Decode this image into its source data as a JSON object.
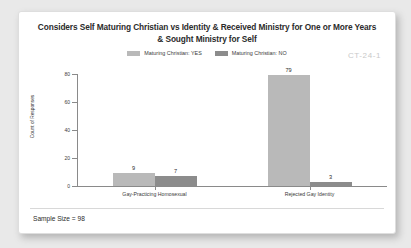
{
  "watermark": "CT-24-1",
  "title": {
    "line1": "Considers Self Maturing Christian vs Identity & Received Ministry for One or More Years",
    "line2": "& Sought Ministry for Self"
  },
  "footer": {
    "sample_size": "Sample Size = 98"
  },
  "colors": {
    "series_yes": "#b9b9b9",
    "series_no": "#8c8c8c",
    "axis": "#8a8a8a",
    "text": "#2b2b2b",
    "watermark": "#c9c9c9",
    "card_background": "#ffffff",
    "page_background": "#e9e9e9"
  },
  "chart_data": {
    "type": "bar",
    "title": "Considers Self Maturing Christian vs Identity & Received Ministry for One or More Years & Sought Ministry for Self",
    "xlabel": "",
    "ylabel": "Count of Responses",
    "categories": [
      "Gay-Practicing Homosexual",
      "Rejected Gay Identity"
    ],
    "series": [
      {
        "name": "Maturing Christian: YES",
        "values": [
          9,
          79
        ],
        "color": "#b9b9b9"
      },
      {
        "name": "Maturing Christian: NO",
        "values": [
          7,
          3
        ],
        "color": "#8c8c8c"
      }
    ],
    "ylim": [
      0,
      80
    ],
    "yticks": [
      0,
      20,
      40,
      60,
      80
    ],
    "ytick_labels": [
      "0",
      "20",
      "40",
      "60",
      "80"
    ],
    "grid": false,
    "legend_position": "top-center",
    "data_labels": true
  }
}
